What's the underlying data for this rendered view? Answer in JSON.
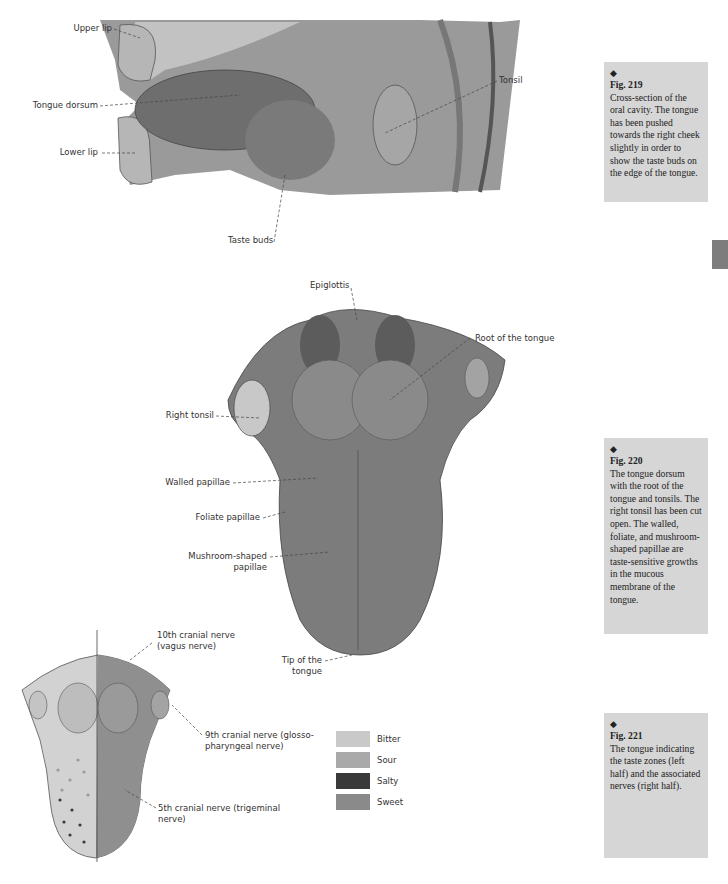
{
  "figures": [
    {
      "number": "Fig. 219",
      "caption": "Cross-section of the oral cavity. The tongue has been pushed towards the right cheek slightly in order to show the taste buds on the edge of the tongue.",
      "labels": [
        "Upper lip",
        "Tongue dorsum",
        "Lower lip",
        "Taste buds",
        "Tonsil"
      ]
    },
    {
      "number": "Fig. 220",
      "caption": "The tongue dorsum with the root of the tongue and tonsils. The right tonsil has been cut open. The walled, foliate, and mushroom-shaped papillae are taste-sensitive growths in the mucous membrane of the tongue.",
      "labels": [
        "Epiglottis",
        "Root of the tongue",
        "Right tonsil",
        "Walled papillae",
        "Foliate papillae",
        "Mushroom-shaped",
        "papillae",
        "Tip of the",
        "tongue"
      ]
    },
    {
      "number": "Fig. 221",
      "caption": "The tongue indicating the taste zones (left half) and the associated nerves (right half).",
      "labels": {
        "nerve10_a": "10th cranial nerve",
        "nerve10_b": "(vagus nerve)",
        "nerve9_a": "9th cranial nerve (glosso-",
        "nerve9_b": "pharyngeal nerve)",
        "nerve5_a": "5th cranial nerve (trigeminal",
        "nerve5_b": "nerve)"
      },
      "legend": [
        {
          "label": "Bitter",
          "color": "#c9c9c9"
        },
        {
          "label": "Sour",
          "color": "#a9a9a9"
        },
        {
          "label": "Salty",
          "color": "#3a3a3a"
        },
        {
          "label": "Sweet",
          "color": "#8a8a8a"
        }
      ]
    }
  ],
  "diamond": "◆"
}
